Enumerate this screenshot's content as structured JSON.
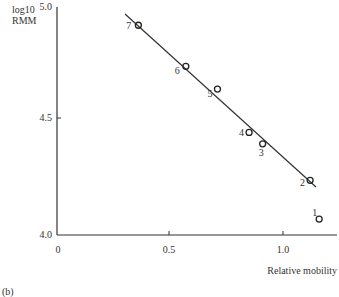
{
  "chart_data": {
    "type": "scatter",
    "title": "",
    "panel_label": "(b)",
    "xlabel": "Relative mobility",
    "ylabel_line1": "log10",
    "ylabel_line2": "RMM",
    "xlim": [
      0,
      1.25
    ],
    "ylim": [
      4.0,
      5.0
    ],
    "x_ticks": [
      "0",
      "0.5",
      "1.0"
    ],
    "y_ticks": [
      "4.0",
      "4.5",
      "5.0"
    ],
    "grid": false,
    "points": [
      {
        "label": "1",
        "x": 1.16,
        "y": 4.07
      },
      {
        "label": "2",
        "x": 1.12,
        "y": 4.24
      },
      {
        "label": "3",
        "x": 0.91,
        "y": 4.4
      },
      {
        "label": "4",
        "x": 0.85,
        "y": 4.45
      },
      {
        "label": "5",
        "x": 0.71,
        "y": 4.64
      },
      {
        "label": "6",
        "x": 0.57,
        "y": 4.74
      },
      {
        "label": "7",
        "x": 0.36,
        "y": 4.92
      }
    ],
    "fit_line": {
      "x": [
        0.3,
        1.14
      ],
      "y": [
        4.97,
        4.21
      ]
    }
  }
}
